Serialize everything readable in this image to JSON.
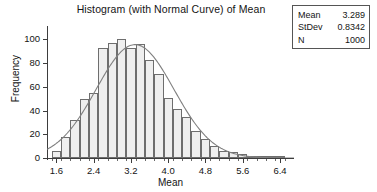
{
  "chart_data": {
    "type": "bar",
    "title": "Histogram (with Normal Curve) of Mean",
    "xlabel": "Mean",
    "ylabel": "Frequency",
    "xlim": [
      1.4,
      6.7
    ],
    "ylim": [
      0,
      108
    ],
    "grid": false,
    "legend": "none",
    "bin_width": 0.2,
    "x_ticks": [
      "1.6",
      "2.4",
      "3.2",
      "4.0",
      "4.8",
      "5.6",
      "6.4"
    ],
    "x_tick_values": [
      1.6,
      2.4,
      3.2,
      4.0,
      4.8,
      5.6,
      6.4
    ],
    "y_ticks": [
      "0",
      "20",
      "40",
      "60",
      "80",
      "100"
    ],
    "y_tick_values": [
      0,
      20,
      40,
      60,
      80,
      100
    ],
    "bin_centers": [
      1.6,
      1.8,
      2.0,
      2.2,
      2.4,
      2.6,
      2.8,
      3.0,
      3.2,
      3.4,
      3.6,
      3.8,
      4.0,
      4.2,
      4.4,
      4.6,
      4.8,
      5.0,
      5.2,
      5.4,
      5.6,
      5.8,
      6.0,
      6.2,
      6.4
    ],
    "values": [
      6,
      18,
      32,
      50,
      55,
      93,
      97,
      100,
      93,
      96,
      83,
      71,
      51,
      41,
      35,
      23,
      16,
      10,
      6,
      5,
      3,
      2,
      2,
      1,
      1
    ],
    "overlay": {
      "type": "line",
      "name": "Normal Curve",
      "mean": 3.289,
      "stdev": 0.8342,
      "n": 1000,
      "color": "#808080"
    }
  },
  "stats_box": {
    "rows": [
      {
        "label": "Mean",
        "value": "3.289"
      },
      {
        "label": "StDev",
        "value": "0.8342"
      },
      {
        "label": "N",
        "value": "1000"
      }
    ]
  },
  "colors": {
    "bar_fill": "#efefef",
    "bar_border": "#6e6e6e",
    "axis": "#3d3d3d",
    "curve": "#808080",
    "text": "#141414"
  }
}
